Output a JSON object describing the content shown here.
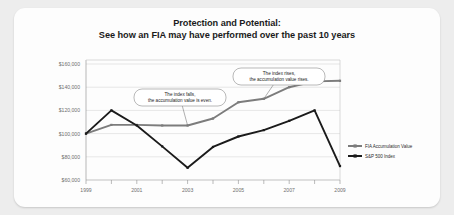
{
  "card": {
    "title_line1": "Protection and Potential:",
    "title_line2": "See how an FIA may have performed over the past 10 years"
  },
  "chart_data": {
    "type": "line",
    "title": "Protection and Potential: See how an FIA may have performed over the past 10 years",
    "xlabel": "",
    "ylabel": "",
    "x": [
      1999,
      2000,
      2001,
      2002,
      2003,
      2004,
      2005,
      2006,
      2007,
      2008,
      2009
    ],
    "categories": [
      "1999",
      "2000",
      "2001",
      "2002",
      "2003",
      "2004",
      "2005",
      "2006",
      "2007",
      "2008",
      "2009"
    ],
    "tick_labels_shown": [
      "1999",
      "2001",
      "2003",
      "2005",
      "2007",
      "2009"
    ],
    "ylim": [
      60000,
      160000
    ],
    "yticks": [
      60000,
      80000,
      100000,
      120000,
      140000,
      160000
    ],
    "ytick_labels": [
      "$60,000",
      "$80,000",
      "$100,000",
      "$120,000",
      "$140,000",
      "$160,000"
    ],
    "grid": true,
    "legend_position": "right",
    "series": [
      {
        "name": "FIA Accumulation Value",
        "color": "#7c7c7c",
        "values": [
          100000,
          107500,
          107500,
          107000,
          107000,
          113000,
          127000,
          130000,
          140000,
          145000,
          145500
        ]
      },
      {
        "name": "S&P 500 Index",
        "color": "#1b1b1b",
        "values": [
          100000,
          120000,
          107000,
          89000,
          70500,
          88500,
          97500,
          103000,
          111000,
          120000,
          72000
        ]
      }
    ],
    "annotations": [
      {
        "id": "annotation-index-falls",
        "line1": "The index falls,",
        "line2": "the accumulation value is even.",
        "target_x": 2003,
        "target_y": 107000
      },
      {
        "id": "annotation-index-rises",
        "line1": "The index rises,",
        "line2": "the accumulation value rises.",
        "target_x": 2006,
        "target_y": 130000
      }
    ]
  }
}
